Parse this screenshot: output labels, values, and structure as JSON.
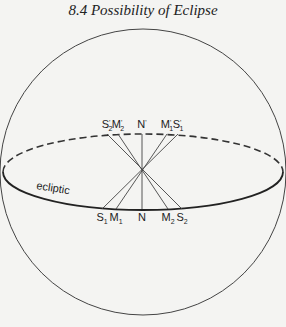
{
  "title": "8.4   Possibility of Eclipse",
  "diagram": {
    "ecliptic_label": "ecliptic",
    "top_labels": [
      {
        "base": "S",
        "sub": "2",
        "prime": true,
        "x": 107
      },
      {
        "base": "M",
        "sub": "2",
        "prime": true,
        "x": 118
      },
      {
        "base": "N",
        "sub": "",
        "prime": true,
        "x": 142
      },
      {
        "base": "M",
        "sub": "1",
        "prime": true,
        "x": 167
      },
      {
        "base": "S",
        "sub": "1",
        "prime": true,
        "x": 178
      }
    ],
    "bottom_labels": [
      {
        "base": "S",
        "sub": "1",
        "x": 102
      },
      {
        "base": "M",
        "sub": "1",
        "x": 116
      },
      {
        "base": "N",
        "sub": "",
        "x": 142
      },
      {
        "base": "M",
        "sub": "2",
        "x": 168
      },
      {
        "base": "S",
        "sub": "2",
        "x": 182
      }
    ],
    "colors": {
      "line": "#333333",
      "background": "#f4f4f2"
    }
  }
}
